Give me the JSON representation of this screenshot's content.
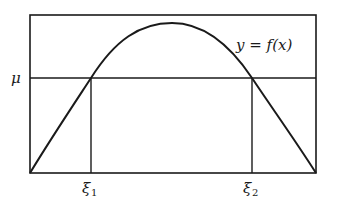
{
  "figure": {
    "curve_label": "y = f(x)",
    "y_level_label": "μ",
    "roots": [
      {
        "symbol": "ξ",
        "subscript": "1"
      },
      {
        "symbol": "ξ",
        "subscript": "2"
      }
    ]
  },
  "colors": {
    "ink": "#1a1a1a",
    "background": "#ffffff"
  }
}
